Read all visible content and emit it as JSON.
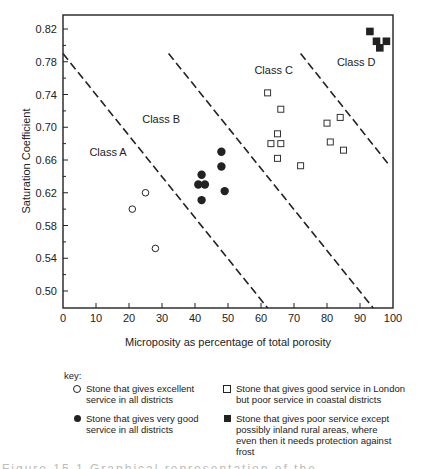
{
  "chart_data": {
    "type": "scatter",
    "title": "",
    "xlabel": "Microposity as percentage of total porosity",
    "ylabel": "Saturation Coefficient",
    "xlim": [
      0,
      100
    ],
    "ylim": [
      0.48,
      0.84
    ],
    "x_ticks": [
      "0",
      "10",
      "20",
      "30",
      "40",
      "50",
      "60",
      "70",
      "80",
      "90",
      "100"
    ],
    "y_ticks": [
      "0.50",
      "0.54",
      "0.58",
      "0.62",
      "0.66",
      "0.70",
      "0.74",
      "0.78",
      "0.82"
    ],
    "grid": false,
    "class_labels": [
      {
        "text": "Class A",
        "x": 8,
        "y": 0.665
      },
      {
        "text": "Class B",
        "x": 24,
        "y": 0.705
      },
      {
        "text": "Class C",
        "x": 58,
        "y": 0.765
      },
      {
        "text": "Class D",
        "x": 83,
        "y": 0.775
      }
    ],
    "boundary_lines": [
      {
        "from": [
          0,
          0.79
        ],
        "to": [
          62,
          0.478
        ]
      },
      {
        "from": [
          32,
          0.79
        ],
        "to": [
          94,
          0.478
        ]
      },
      {
        "from": [
          72,
          0.79
        ],
        "to": [
          99,
          0.653
        ]
      }
    ],
    "series": [
      {
        "name": "Stone that gives excellent service in all districts",
        "marker": "open-circle",
        "points": [
          [
            21,
            0.6
          ],
          [
            25,
            0.62
          ],
          [
            28,
            0.552
          ]
        ]
      },
      {
        "name": "Stone that gives very good service in all districts",
        "marker": "filled-circle",
        "points": [
          [
            41,
            0.63
          ],
          [
            43,
            0.63
          ],
          [
            42,
            0.642
          ],
          [
            42,
            0.611
          ],
          [
            48,
            0.67
          ],
          [
            48,
            0.652
          ],
          [
            49,
            0.622
          ]
        ]
      },
      {
        "name": "Stone that gives good service in London but poor service in coastal districts",
        "marker": "open-square",
        "points": [
          [
            62,
            0.742
          ],
          [
            66,
            0.722
          ],
          [
            65,
            0.692
          ],
          [
            63,
            0.68
          ],
          [
            66,
            0.68
          ],
          [
            65,
            0.662
          ],
          [
            72,
            0.653
          ],
          [
            80,
            0.705
          ],
          [
            84,
            0.712
          ],
          [
            81,
            0.682
          ],
          [
            85,
            0.672
          ]
        ]
      },
      {
        "name": "Stone that gives poor service except possibly inland rural areas, where even then it needs protection against frost",
        "marker": "filled-square",
        "points": [
          [
            93,
            0.817
          ],
          [
            95,
            0.805
          ],
          [
            98,
            0.805
          ],
          [
            96,
            0.797
          ]
        ]
      }
    ],
    "legend_position": "bottom"
  },
  "legend": {
    "key_label": "key:",
    "items": [
      {
        "symbol": "open-circle",
        "text": "Stone that gives excellent\nservice in all districts"
      },
      {
        "symbol": "open-square",
        "text": "Stone that gives good service in London\nbut poor service in coastal districts"
      },
      {
        "symbol": "filled-circle",
        "text": "Stone that gives very good\nservice in all districts"
      },
      {
        "symbol": "filled-square",
        "text": "Stone that gives poor service except\npossibly inland rural areas, where\neven then it needs protection against\nfrost"
      }
    ]
  },
  "caption": "Figure 15.1  Graphical representation of the classification..."
}
